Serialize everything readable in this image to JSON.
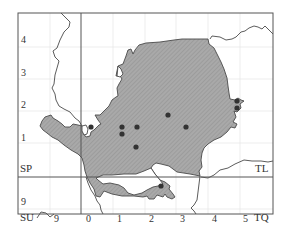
{
  "map": {
    "grid_labels": {
      "left": [
        {
          "text": "4",
          "x": 21,
          "y": 35
        },
        {
          "text": "3",
          "x": 21,
          "y": 68
        },
        {
          "text": "2",
          "x": 21,
          "y": 100
        },
        {
          "text": "1",
          "x": 21,
          "y": 133
        },
        {
          "text": "9",
          "x": 21,
          "y": 197
        }
      ],
      "bottom": [
        {
          "text": "9",
          "x": 54,
          "y": 214
        },
        {
          "text": "0",
          "x": 86,
          "y": 214
        },
        {
          "text": "1",
          "x": 117,
          "y": 214
        },
        {
          "text": "2",
          "x": 149,
          "y": 214
        },
        {
          "text": "3",
          "x": 180,
          "y": 214
        },
        {
          "text": "4",
          "x": 212,
          "y": 214
        },
        {
          "text": "5",
          "x": 243,
          "y": 214
        }
      ],
      "squares": [
        {
          "text": "SP",
          "x": 21,
          "y": 163
        },
        {
          "text": "TL",
          "x": 255,
          "y": 163
        },
        {
          "text": "SU",
          "x": 21,
          "y": 213
        },
        {
          "text": "TQ",
          "x": 254,
          "y": 213
        }
      ]
    },
    "records": [
      {
        "x": 91,
        "y": 127
      },
      {
        "x": 122,
        "y": 127
      },
      {
        "x": 122,
        "y": 134
      },
      {
        "x": 137,
        "y": 127
      },
      {
        "x": 168,
        "y": 115
      },
      {
        "x": 186,
        "y": 127
      },
      {
        "x": 136,
        "y": 147
      },
      {
        "x": 161,
        "y": 186
      },
      {
        "x": 237,
        "y": 101
      },
      {
        "x": 237,
        "y": 108
      }
    ],
    "colors": {
      "fill": "#a9a9a9",
      "hatch": "#8c8c8c",
      "border": "#4a4a4a",
      "grid": "#e6e6e6",
      "dot": "#333333"
    }
  }
}
